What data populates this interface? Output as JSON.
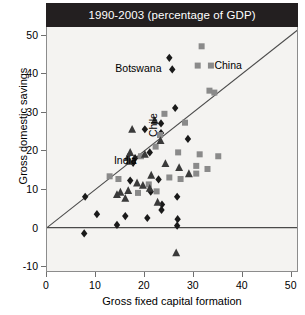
{
  "chart_data": {
    "type": "scatter",
    "title": "1990-2003 (percentage of GDP)",
    "xlabel": "Gross fixed capital formation",
    "ylabel": "Gross domestic savings",
    "xlim": [
      0,
      51.5
    ],
    "ylim": [
      -11.5,
      52
    ],
    "xticks": [
      0,
      10,
      20,
      30,
      40,
      50
    ],
    "yticks": [
      -10,
      0,
      10,
      20,
      30,
      40,
      50
    ],
    "grid": false,
    "legend_position": "none",
    "reference_lines": [
      {
        "name": "forty-five-degree-line",
        "type": "diagonal",
        "from": [
          0,
          0
        ],
        "to": [
          51.5,
          51.5
        ]
      },
      {
        "name": "zero-savings-line",
        "type": "horizontal",
        "y": 0
      }
    ],
    "series": [
      {
        "name": "diamond-series",
        "marker": "diamond",
        "color": "#1a1a1a",
        "points": [
          [
            25.0,
            44.0
          ],
          [
            25.6,
            41.0
          ],
          [
            26.2,
            31.0
          ],
          [
            23.3,
            27.0
          ],
          [
            23.3,
            24.5
          ],
          [
            20.0,
            25.5
          ],
          [
            28.8,
            23.0
          ],
          [
            21.0,
            19.5
          ],
          [
            18.0,
            18.0
          ],
          [
            17.6,
            16.8
          ],
          [
            22.8,
            12.5
          ],
          [
            17.0,
            12.2
          ],
          [
            7.8,
            8.0
          ],
          [
            21.2,
            9.3
          ],
          [
            26.6,
            8.0
          ],
          [
            23.5,
            6.0
          ],
          [
            23.4,
            4.6
          ],
          [
            10.2,
            3.5
          ],
          [
            16.0,
            3.0
          ],
          [
            20.5,
            2.5
          ],
          [
            26.7,
            2.2
          ],
          [
            26.6,
            0.5
          ],
          [
            14.3,
            0.7
          ],
          [
            7.6,
            -1.5
          ]
        ]
      },
      {
        "name": "square-series",
        "marker": "square",
        "color": "#8a8a8a",
        "points": [
          [
            31.6,
            47.0
          ],
          [
            30.8,
            42.0
          ],
          [
            33.5,
            42.0
          ],
          [
            33.2,
            35.5
          ],
          [
            34.2,
            35.0
          ],
          [
            24.0,
            29.5
          ],
          [
            28.2,
            27.2
          ],
          [
            23.1,
            24.0
          ],
          [
            22.2,
            21.0
          ],
          [
            26.8,
            19.5
          ],
          [
            31.2,
            19.0
          ],
          [
            35.0,
            18.5
          ],
          [
            30.5,
            16.0
          ],
          [
            30.5,
            14.0
          ],
          [
            32.8,
            15.2
          ],
          [
            12.8,
            13.3
          ],
          [
            14.6,
            12.6
          ],
          [
            19.2,
            18.5
          ],
          [
            25.0,
            13.0
          ],
          [
            27.3,
            12.6
          ],
          [
            20.8,
            11.2
          ],
          [
            22.4,
            9.4
          ],
          [
            18.6,
            9.0
          ]
        ]
      },
      {
        "name": "triangle-series",
        "marker": "triangle",
        "color": "#3a3a3a",
        "points": [
          [
            22.0,
            27.8
          ],
          [
            17.4,
            25.5
          ],
          [
            23.2,
            22.6
          ],
          [
            20.0,
            19.0
          ],
          [
            17.0,
            19.5
          ],
          [
            16.5,
            18.2
          ],
          [
            16.8,
            17.2
          ],
          [
            24.2,
            16.6
          ],
          [
            27.0,
            15.6
          ],
          [
            29.0,
            14.0
          ],
          [
            21.3,
            13.6
          ],
          [
            18.4,
            11.6
          ],
          [
            19.6,
            11.0
          ],
          [
            21.0,
            10.2
          ],
          [
            16.6,
            9.6
          ],
          [
            15.0,
            9.2
          ],
          [
            14.3,
            8.6
          ],
          [
            16.0,
            7.6
          ],
          [
            22.6,
            6.6
          ],
          [
            26.4,
            -6.5
          ]
        ]
      }
    ],
    "annotations": [
      {
        "name": "botswana-label",
        "text": "Botswana",
        "x": 24.6,
        "y": 41.0,
        "rotation": 0
      },
      {
        "name": "china-label",
        "text": "China",
        "x": 33.4,
        "y": 42.0,
        "rotation": 0
      },
      {
        "name": "chile-label",
        "text": "Chile",
        "x": 23.6,
        "y": 25.5,
        "rotation": -90
      },
      {
        "name": "india-label",
        "text": "India",
        "x": 19.2,
        "y": 18.4,
        "rotation": 0
      }
    ]
  }
}
